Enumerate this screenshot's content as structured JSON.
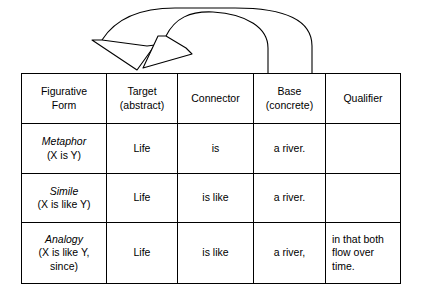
{
  "diagram": {
    "arrows": {
      "count": 2,
      "description": "two curved arrows arcing leftward from the Base and Qualifier columns to the Target (abstract) column",
      "arrow_1_name": "base-to-target-arrow",
      "arrow_2_name": "qualifier-to-target-arrow",
      "color": "#000000",
      "style": "open outline arrowhead"
    }
  },
  "table": {
    "columns": [
      {
        "key": "form",
        "label_line1": "Figurative",
        "label_line2": "Form"
      },
      {
        "key": "target",
        "label_line1": "Target",
        "label_line2": "(abstract)"
      },
      {
        "key": "connector",
        "label_line1": "Connector",
        "label_line2": ""
      },
      {
        "key": "base",
        "label_line1": "Base",
        "label_line2": "(concrete)"
      },
      {
        "key": "qualifier",
        "label_line1": "Qualifier",
        "label_line2": ""
      }
    ],
    "rows": [
      {
        "form_name": "Metaphor",
        "form_pattern": "(X is Y)",
        "target": "Life",
        "connector": "is",
        "base": "a river.",
        "qualifier_lines": []
      },
      {
        "form_name": "Simile",
        "form_pattern": "(X is like Y)",
        "target": "Life",
        "connector": "is like",
        "base": "a river.",
        "qualifier_lines": []
      },
      {
        "form_name": "Analogy",
        "form_pattern_line1": "(X is like Y,",
        "form_pattern_line2": "since)",
        "target": "Life",
        "connector": "is like",
        "base": "a river,",
        "qualifier_lines": [
          "in that both",
          "flow over",
          "time."
        ]
      }
    ]
  }
}
